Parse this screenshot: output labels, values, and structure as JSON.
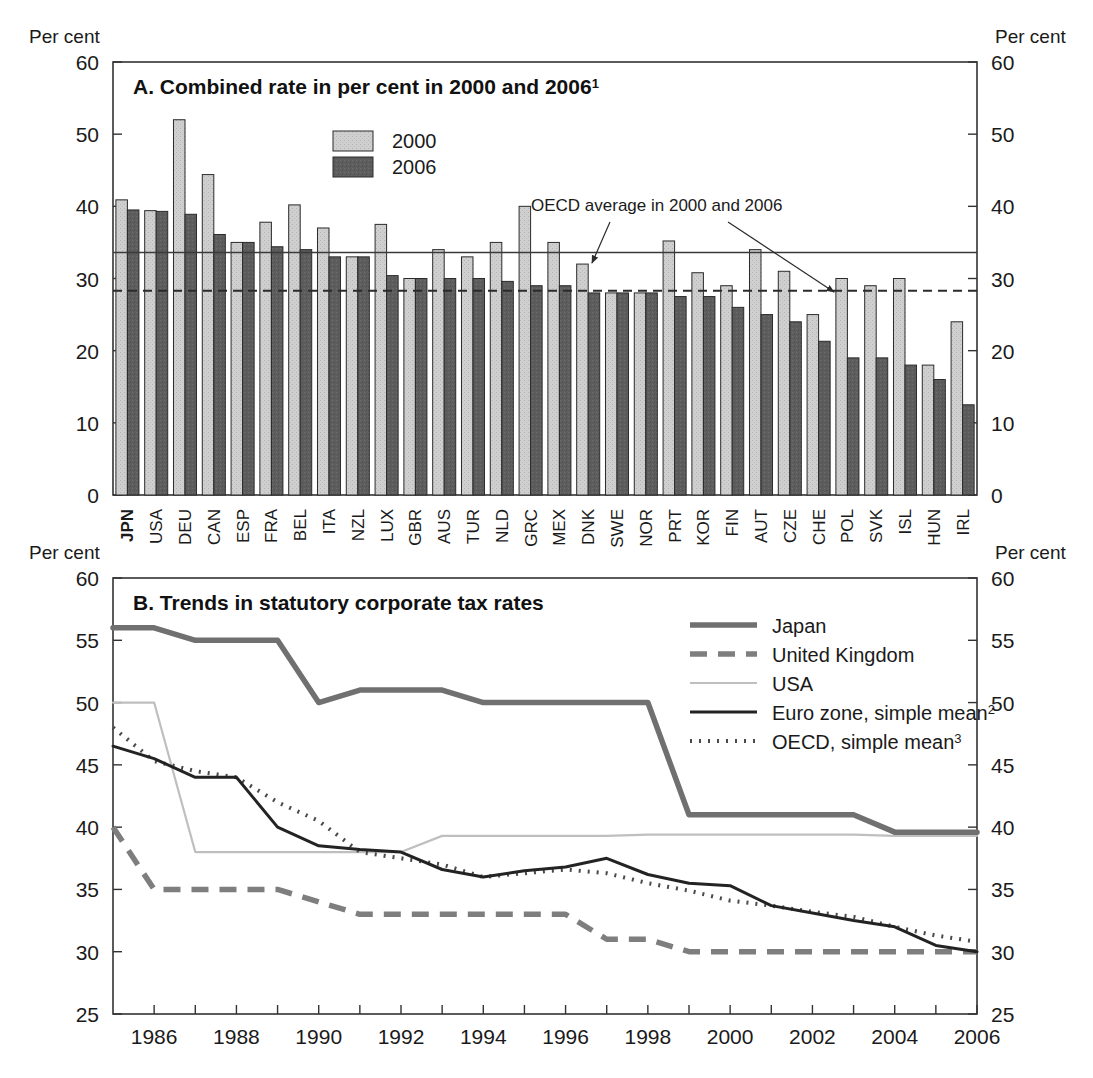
{
  "figure": {
    "axis_unit_label": "Per cent"
  },
  "panelA": {
    "title": "A. Combined rate in per cent in 2000 and 2006",
    "title_footnote": "1",
    "annotation": "OECD average in 2000 and 2006",
    "legend": [
      {
        "label": "2000",
        "color": "#c9c9c9",
        "name": "legend-2000"
      },
      {
        "label": "2006",
        "color": "#595959",
        "name": "legend-2006"
      }
    ],
    "y_ticks": [
      "0",
      "10",
      "20",
      "30",
      "40",
      "50",
      "60"
    ],
    "colors": {
      "bar2000": "#c9c9c9",
      "bar2006": "#595959",
      "stroke": "#2b2b2b"
    }
  },
  "panelB": {
    "title": "B. Trends in statutory corporate tax rates",
    "y_ticks": [
      "25",
      "30",
      "35",
      "40",
      "45",
      "50",
      "55",
      "60"
    ],
    "x_ticks": [
      "1986",
      "1988",
      "1990",
      "1992",
      "1994",
      "1996",
      "1998",
      "2000",
      "2002",
      "2004",
      "2006"
    ],
    "legend": [
      {
        "label": "Japan",
        "footnote": "",
        "color": "#707070",
        "style": "solid-thick",
        "name": "legend-japan"
      },
      {
        "label": "United Kingdom",
        "footnote": "",
        "color": "#7a7a7a",
        "style": "dashed-thick",
        "name": "legend-united-kingdom"
      },
      {
        "label": "USA",
        "footnote": "",
        "color": "#bdbdbd",
        "style": "solid-thin",
        "name": "legend-usa"
      },
      {
        "label": "Euro zone, simple mean",
        "footnote": "2",
        "color": "#232323",
        "style": "solid-medium",
        "name": "legend-euro-zone"
      },
      {
        "label": "OECD, simple mean",
        "footnote": "3",
        "color": "#4a4a4a",
        "style": "dotted",
        "name": "legend-oecd"
      }
    ]
  },
  "chart_data": [
    {
      "type": "bar",
      "title": "A. Combined rate in per cent in 2000 and 2006",
      "xlabel": "",
      "ylabel": "Per cent",
      "ylim": [
        0,
        60
      ],
      "yticks": [
        0,
        10,
        20,
        30,
        40,
        50,
        60
      ],
      "grid": false,
      "legend_position": "inside-top-center",
      "categories": [
        "JPN",
        "USA",
        "DEU",
        "CAN",
        "ESP",
        "FRA",
        "BEL",
        "ITA",
        "NZL",
        "LUX",
        "GBR",
        "AUS",
        "TUR",
        "NLD",
        "GRC",
        "MEX",
        "DNK",
        "SWE",
        "NOR",
        "PRT",
        "KOR",
        "FIN",
        "AUT",
        "CZE",
        "CHE",
        "POL",
        "SVK",
        "ISL",
        "HUN",
        "IRL"
      ],
      "series": [
        {
          "name": "2000",
          "values": [
            40.9,
            39.4,
            52.0,
            44.4,
            35.0,
            37.8,
            40.2,
            37.0,
            33.0,
            37.5,
            30.0,
            34.0,
            33.0,
            35.0,
            40.0,
            35.0,
            32.0,
            28.0,
            28.0,
            35.2,
            30.8,
            29.0,
            34.0,
            31.0,
            25.0,
            30.0,
            29.0,
            30.0,
            18.0,
            24.0
          ]
        },
        {
          "name": "2006",
          "values": [
            39.5,
            39.3,
            38.9,
            36.1,
            35.0,
            34.4,
            34.0,
            33.0,
            33.0,
            30.4,
            30.0,
            30.0,
            30.0,
            29.6,
            29.0,
            29.0,
            28.0,
            28.0,
            28.0,
            27.5,
            27.5,
            26.0,
            25.0,
            24.0,
            21.3,
            19.0,
            19.0,
            18.0,
            16.0,
            12.5
          ]
        }
      ],
      "reference_lines": [
        {
          "label": "OECD average in 2000",
          "value": 33.6,
          "style": "solid"
        },
        {
          "label": "OECD average in 2006",
          "value": 28.3,
          "style": "dashed"
        }
      ],
      "annotations": [
        {
          "text": "OECD average in 2000 and 2006",
          "x": 16.2,
          "y": 43.0
        }
      ]
    },
    {
      "type": "line",
      "title": "B. Trends in statutory corporate tax rates",
      "xlabel": "",
      "ylabel": "Per cent",
      "ylim": [
        25,
        60
      ],
      "yticks": [
        25,
        30,
        35,
        40,
        45,
        50,
        55,
        60
      ],
      "xlim": [
        1985,
        2006
      ],
      "grid": false,
      "legend_position": "inside-top-right",
      "x": [
        1985,
        1986,
        1987,
        1988,
        1989,
        1990,
        1991,
        1992,
        1993,
        1994,
        1995,
        1996,
        1997,
        1998,
        1999,
        2000,
        2001,
        2002,
        2003,
        2004,
        2005,
        2006
      ],
      "series": [
        {
          "name": "Japan",
          "values": [
            56.0,
            56.0,
            55.0,
            55.0,
            55.0,
            50.0,
            51.0,
            51.0,
            51.0,
            50.0,
            50.0,
            50.0,
            50.0,
            50.0,
            41.0,
            41.0,
            41.0,
            41.0,
            41.0,
            39.6,
            39.6,
            39.6
          ]
        },
        {
          "name": "United Kingdom",
          "values": [
            40.0,
            35.0,
            35.0,
            35.0,
            35.0,
            34.0,
            33.0,
            33.0,
            33.0,
            33.0,
            33.0,
            33.0,
            31.0,
            31.0,
            30.0,
            30.0,
            30.0,
            30.0,
            30.0,
            30.0,
            30.0,
            30.0
          ]
        },
        {
          "name": "USA",
          "values": [
            50.0,
            50.0,
            38.0,
            38.0,
            38.0,
            38.0,
            38.0,
            38.0,
            39.3,
            39.3,
            39.3,
            39.3,
            39.3,
            39.4,
            39.4,
            39.4,
            39.4,
            39.4,
            39.4,
            39.3,
            39.3,
            39.3
          ]
        },
        {
          "name": "Euro zone, simple mean",
          "values": [
            46.5,
            45.5,
            44.0,
            44.0,
            40.0,
            38.5,
            38.2,
            38.0,
            36.6,
            36.0,
            36.5,
            36.8,
            37.5,
            36.2,
            35.5,
            35.3,
            33.7,
            33.1,
            32.5,
            32.0,
            30.5,
            30.0
          ]
        },
        {
          "name": "OECD, simple mean",
          "values": [
            48.0,
            45.3,
            44.5,
            44.0,
            42.0,
            40.5,
            38.0,
            37.5,
            37.0,
            36.0,
            36.3,
            36.6,
            36.3,
            35.5,
            34.9,
            34.1,
            33.7,
            33.2,
            32.8,
            32.0,
            31.3,
            30.8
          ]
        }
      ]
    }
  ]
}
